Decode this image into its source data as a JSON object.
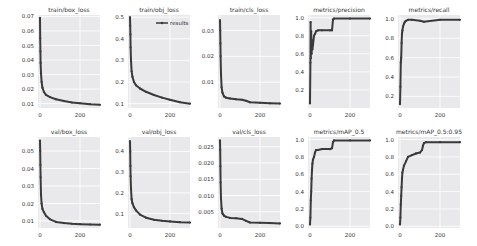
{
  "figure": {
    "layout": "2x5 grid",
    "background": "#ffffff",
    "plot_bg": "#e9e9ec",
    "grid_color": "#ffffff",
    "line_color": "#3a3a3a",
    "marker": "dot"
  },
  "legend": {
    "label": "results",
    "subplot": "train/obj_loss",
    "position": "upper right"
  },
  "chart_data": [
    {
      "type": "line",
      "title": "train/box_loss",
      "row": 0,
      "col": 0,
      "yticks": [
        "0.01",
        "0.02",
        "0.03",
        "0.04",
        "0.05",
        "0.06",
        "0.07"
      ],
      "ylim": [
        0.007,
        0.071
      ],
      "xticks": [
        "0",
        "200"
      ],
      "xlim": [
        -10,
        300
      ],
      "x": [
        0,
        1,
        2,
        3,
        5,
        8,
        12,
        20,
        30,
        50,
        80,
        120,
        160,
        200,
        250,
        300
      ],
      "y": [
        0.069,
        0.055,
        0.046,
        0.038,
        0.031,
        0.025,
        0.021,
        0.018,
        0.016,
        0.0145,
        0.013,
        0.0118,
        0.0108,
        0.0102,
        0.0096,
        0.0092
      ]
    },
    {
      "type": "line",
      "title": "train/obj_loss",
      "row": 0,
      "col": 1,
      "yticks": [
        "0.1",
        "0.2",
        "0.3",
        "0.4",
        "0.5"
      ],
      "ylim": [
        0.08,
        0.51
      ],
      "xticks": [
        "0",
        "200"
      ],
      "xlim": [
        -10,
        300
      ],
      "x": [
        0,
        1,
        2,
        3,
        5,
        8,
        12,
        20,
        30,
        50,
        80,
        120,
        160,
        200,
        250,
        300
      ],
      "y": [
        0.5,
        0.46,
        0.42,
        0.36,
        0.3,
        0.25,
        0.225,
        0.2,
        0.185,
        0.17,
        0.155,
        0.14,
        0.128,
        0.118,
        0.107,
        0.1
      ]
    },
    {
      "type": "line",
      "title": "train/cls_loss",
      "row": 0,
      "col": 2,
      "yticks": [
        "0.01",
        "0.02",
        "0.03"
      ],
      "ylim": [
        0.0,
        0.036
      ],
      "xticks": [
        "0",
        "200"
      ],
      "xlim": [
        -10,
        300
      ],
      "x": [
        0,
        1,
        2,
        3,
        5,
        8,
        12,
        20,
        30,
        50,
        80,
        110,
        130,
        150,
        200,
        250,
        300
      ],
      "y": [
        0.034,
        0.03,
        0.025,
        0.02,
        0.013,
        0.008,
        0.006,
        0.0045,
        0.004,
        0.0037,
        0.0034,
        0.0032,
        0.0028,
        0.0022,
        0.002,
        0.0018,
        0.0017
      ]
    },
    {
      "type": "line",
      "title": "metrics/precision",
      "row": 0,
      "col": 3,
      "yticks": [
        "0.2",
        "0.4",
        "0.6",
        "0.8",
        "1.0"
      ],
      "ylim": [
        0.0,
        1.03
      ],
      "xticks": [
        "0",
        "200"
      ],
      "xlim": [
        -10,
        300
      ],
      "x": [
        0,
        2,
        3,
        4,
        6,
        8,
        10,
        12,
        15,
        20,
        25,
        30,
        40,
        60,
        100,
        110,
        115,
        120,
        200,
        300
      ],
      "y": [
        0.05,
        0.5,
        0.95,
        0.55,
        0.85,
        0.6,
        0.75,
        0.65,
        0.7,
        0.8,
        0.82,
        0.85,
        0.86,
        0.86,
        0.86,
        0.86,
        0.98,
        0.99,
        0.99,
        0.99
      ]
    },
    {
      "type": "line",
      "title": "metrics/recall",
      "row": 0,
      "col": 4,
      "yticks": [
        "0.2",
        "0.4",
        "0.6",
        "0.8",
        "1.0"
      ],
      "ylim": [
        0.08,
        1.04
      ],
      "xticks": [
        "0",
        "200"
      ],
      "xlim": [
        -10,
        300
      ],
      "x": [
        0,
        2,
        4,
        6,
        8,
        10,
        12,
        15,
        20,
        25,
        30,
        40,
        60,
        100,
        120,
        200,
        300
      ],
      "y": [
        0.12,
        0.3,
        0.55,
        0.6,
        0.75,
        0.85,
        0.88,
        0.92,
        0.95,
        0.97,
        0.98,
        0.99,
        0.99,
        0.98,
        0.97,
        0.99,
        0.99
      ]
    },
    {
      "type": "line",
      "title": "val/box_loss",
      "row": 1,
      "col": 0,
      "yticks": [
        "0.01",
        "0.02",
        "0.03",
        "0.04",
        "0.05"
      ],
      "ylim": [
        0.006,
        0.058
      ],
      "xticks": [
        "0",
        "200"
      ],
      "xlim": [
        -10,
        300
      ],
      "x": [
        0,
        1,
        2,
        3,
        5,
        8,
        12,
        20,
        30,
        50,
        80,
        120,
        160,
        200,
        250,
        300
      ],
      "y": [
        0.056,
        0.05,
        0.042,
        0.035,
        0.025,
        0.02,
        0.017,
        0.015,
        0.013,
        0.011,
        0.0095,
        0.0088,
        0.0084,
        0.0082,
        0.008,
        0.0079
      ]
    },
    {
      "type": "line",
      "title": "val/obj_loss",
      "row": 1,
      "col": 1,
      "yticks": [
        "0.1",
        "0.2",
        "0.3",
        "0.4"
      ],
      "ylim": [
        0.03,
        0.47
      ],
      "xticks": [
        "0",
        "200"
      ],
      "xlim": [
        -10,
        300
      ],
      "x": [
        0,
        1,
        2,
        3,
        5,
        8,
        12,
        20,
        30,
        50,
        80,
        120,
        160,
        200,
        250,
        300
      ],
      "y": [
        0.45,
        0.4,
        0.33,
        0.28,
        0.22,
        0.17,
        0.15,
        0.13,
        0.115,
        0.095,
        0.08,
        0.07,
        0.065,
        0.062,
        0.058,
        0.056
      ]
    },
    {
      "type": "line",
      "title": "val/cls_loss",
      "row": 1,
      "col": 2,
      "yticks": [
        "0.005",
        "0.010",
        "0.015",
        "0.020",
        "0.025"
      ],
      "ylim": [
        0.0,
        0.028
      ],
      "xticks": [
        "0",
        "200"
      ],
      "xlim": [
        -10,
        300
      ],
      "x": [
        0,
        1,
        2,
        3,
        5,
        8,
        12,
        20,
        30,
        50,
        80,
        110,
        130,
        150,
        200,
        250,
        300
      ],
      "y": [
        0.027,
        0.024,
        0.019,
        0.014,
        0.009,
        0.006,
        0.0045,
        0.0038,
        0.0034,
        0.0031,
        0.003,
        0.0028,
        0.0022,
        0.0017,
        0.0016,
        0.0015,
        0.0014
      ]
    },
    {
      "type": "line",
      "title": "metrics/mAP_0.5",
      "row": 1,
      "col": 3,
      "yticks": [
        "0.0",
        "0.2",
        "0.4",
        "0.6",
        "0.8",
        "1.0"
      ],
      "ylim": [
        -0.02,
        1.03
      ],
      "xticks": [
        "0",
        "200"
      ],
      "xlim": [
        -10,
        300
      ],
      "x": [
        0,
        2,
        4,
        6,
        8,
        10,
        12,
        15,
        20,
        25,
        30,
        40,
        60,
        100,
        110,
        115,
        120,
        200,
        300
      ],
      "y": [
        0.02,
        0.1,
        0.3,
        0.4,
        0.55,
        0.65,
        0.72,
        0.77,
        0.8,
        0.85,
        0.88,
        0.88,
        0.89,
        0.89,
        0.9,
        0.97,
        0.99,
        0.99,
        0.99
      ]
    },
    {
      "type": "line",
      "title": "metrics/mAP_0.5:0.95",
      "row": 1,
      "col": 4,
      "yticks": [
        "0.0",
        "0.2",
        "0.4",
        "0.6",
        "0.8",
        "1.0"
      ],
      "ylim": [
        -0.02,
        1.03
      ],
      "xticks": [
        "0",
        "200"
      ],
      "xlim": [
        -10,
        300
      ],
      "x": [
        0,
        2,
        4,
        6,
        8,
        10,
        12,
        15,
        20,
        30,
        40,
        60,
        80,
        100,
        110,
        115,
        120,
        130,
        200,
        300
      ],
      "y": [
        0.02,
        0.1,
        0.25,
        0.35,
        0.45,
        0.55,
        0.62,
        0.65,
        0.7,
        0.75,
        0.8,
        0.82,
        0.84,
        0.85,
        0.88,
        0.93,
        0.96,
        0.97,
        0.97,
        0.97
      ]
    }
  ]
}
